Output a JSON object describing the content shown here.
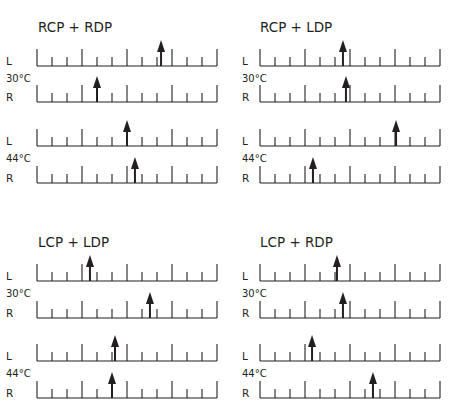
{
  "figure": {
    "scale": {
      "intervals": 12,
      "major_every": 3,
      "tick_spacing_px": 15
    },
    "colors": {
      "ink": "#231f20",
      "background": "#ffffff"
    },
    "side_labels": {
      "left": "L",
      "right": "R"
    },
    "panels": [
      {
        "title": "RCP + RDP",
        "groups": [
          {
            "temperature": "30°C",
            "L": 8.27,
            "R": 4.0
          },
          {
            "temperature": "44°C",
            "L": 6.0,
            "R": 6.53
          }
        ]
      },
      {
        "title": "RCP + LDP",
        "groups": [
          {
            "temperature": "30°C",
            "L": 5.53,
            "R": 5.73
          },
          {
            "temperature": "44°C",
            "L": 9.07,
            "R": 3.53
          }
        ]
      },
      {
        "title": "LCP + LDP",
        "groups": [
          {
            "temperature": "30°C",
            "L": 3.53,
            "R": 7.53
          },
          {
            "temperature": "44°C",
            "L": 5.2,
            "R": 5.0
          }
        ]
      },
      {
        "title": "LCP + RDP",
        "groups": [
          {
            "temperature": "30°C",
            "L": 5.13,
            "R": 5.53
          },
          {
            "temperature": "44°C",
            "L": 3.47,
            "R": 7.53
          }
        ]
      }
    ]
  }
}
